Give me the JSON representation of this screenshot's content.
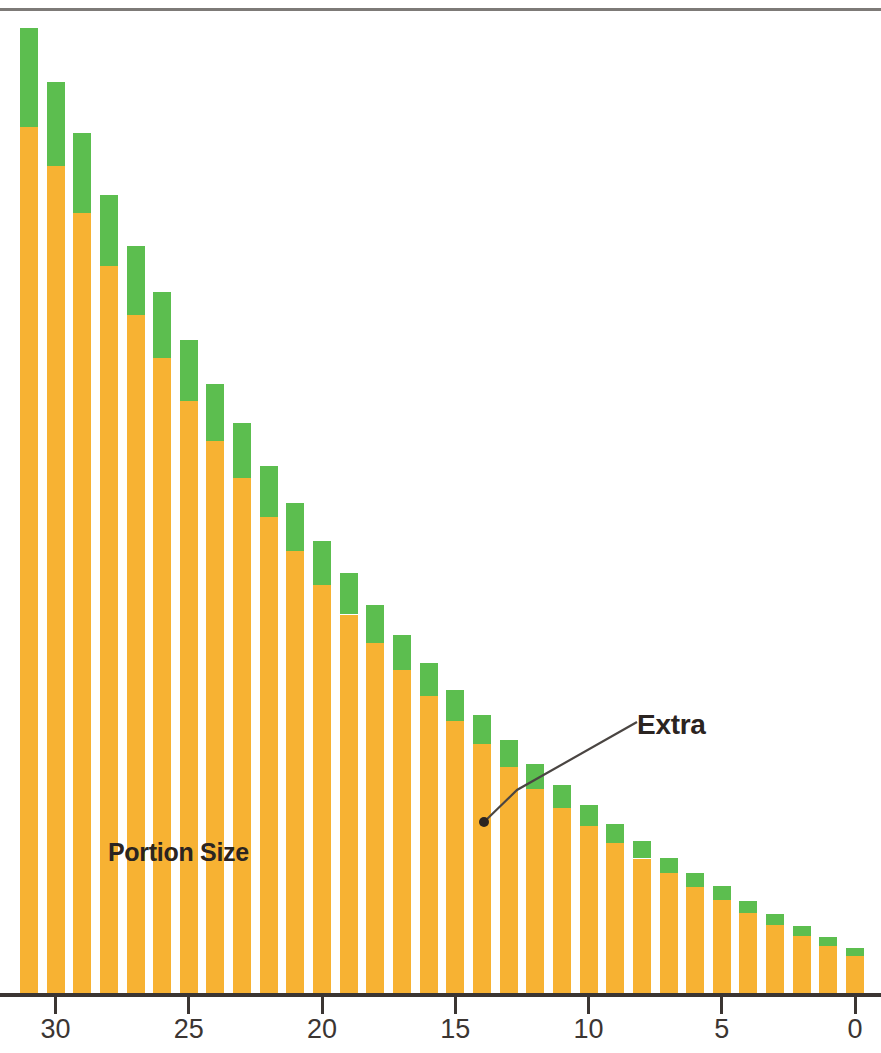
{
  "chart_data": {
    "type": "bar",
    "subtype": "stacked-bar",
    "title": "",
    "subtitle": "",
    "xlabel": "",
    "ylabel": "",
    "orientation": "vertical",
    "x_axis_reversed": true,
    "grid": false,
    "legend_position": "inline-annotation",
    "categories": [
      31,
      30,
      29,
      28,
      27,
      26,
      25,
      24,
      23,
      22,
      21,
      20,
      19,
      18,
      17,
      16,
      15,
      14,
      13,
      12,
      11,
      10,
      9,
      8,
      7,
      6,
      5,
      4,
      3,
      2,
      1,
      0
    ],
    "xlim": [
      31.5,
      -0.5
    ],
    "ylim": [
      0,
      100
    ],
    "xticks": [
      30,
      25,
      20,
      15,
      10,
      5,
      0
    ],
    "xtick_labels": [
      "30",
      "25",
      "20",
      "15",
      "10",
      "5",
      "0"
    ],
    "series": [
      {
        "name": "Portion Size",
        "color": "#F7B233",
        "values": [
          87.2,
          83.2,
          78.5,
          73.2,
          68.3,
          64.0,
          59.6,
          55.6,
          51.9,
          48.0,
          44.6,
          41.2,
          38.2,
          35.3,
          32.6,
          30.0,
          27.5,
          25.2,
          22.9,
          20.7,
          18.8,
          17.0,
          15.3,
          13.7,
          12.2,
          10.8,
          9.5,
          8.2,
          7.0,
          5.9,
          4.9,
          3.9
        ]
      },
      {
        "name": "Extra",
        "color": "#5CBE4F",
        "values": [
          9.9,
          8.5,
          8.1,
          7.1,
          6.9,
          6.6,
          6.2,
          5.8,
          5.5,
          5.1,
          4.8,
          4.4,
          4.2,
          3.9,
          3.6,
          3.3,
          3.1,
          2.9,
          2.7,
          2.5,
          2.3,
          2.1,
          1.9,
          1.8,
          1.6,
          1.5,
          1.4,
          1.2,
          1.1,
          1.0,
          0.9,
          0.8
        ]
      }
    ],
    "annotations": [
      {
        "text": "Portion Size",
        "target_series": "Portion Size",
        "style": "inline-bold-dark"
      },
      {
        "text": "Extra",
        "target_series": "Extra",
        "target_category": 14,
        "style": "leader-line-with-dot"
      }
    ],
    "colors": {
      "portion_size": "#F7B233",
      "extra": "#5CBE4F",
      "axis": "#3b3532",
      "rule": "#7d7a77",
      "label_text": "#2b2421",
      "background": "#ffffff"
    }
  },
  "labels": {
    "portion_size": "Portion Size",
    "extra": "Extra"
  },
  "axis": {
    "tick_labels": [
      "30",
      "25",
      "20",
      "15",
      "10",
      "5",
      "0"
    ]
  }
}
